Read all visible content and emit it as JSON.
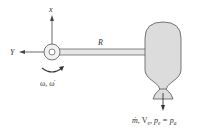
{
  "diagram": {
    "labels": {
      "x_axis": "x",
      "y_axis": "Y",
      "origin": "O",
      "arm_length": "R",
      "rotation": "ω, ω̇",
      "exhaust_m": "ṁ",
      "exhaust_rest": ", V",
      "exhaust_ve_sub": "e",
      "exhaust_p": ", p",
      "exhaust_pe_sub": "e",
      "exhaust_eq": " = p",
      "exhaust_pa_sub": "a"
    },
    "colors": {
      "stroke": "#555555",
      "body_fill": "#dcdcdc",
      "arm_fill": "#e6e6e6",
      "text": "#333333"
    }
  }
}
